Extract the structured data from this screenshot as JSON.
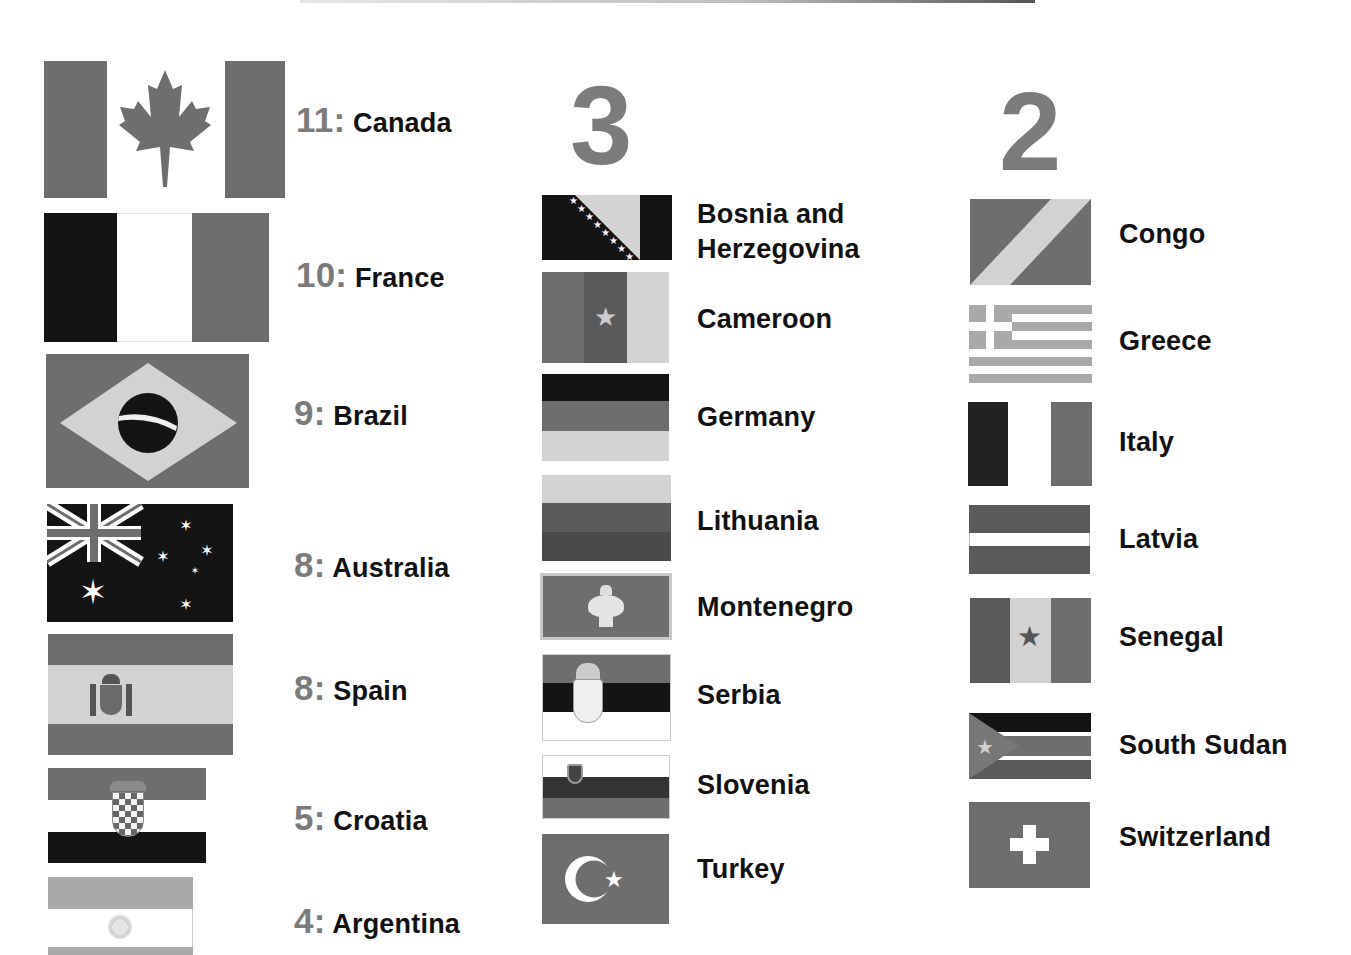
{
  "colors": {
    "dark": "#141414",
    "mid": "#6e6e6e",
    "light": "#d2d2d2",
    "number": "#7b7b7b"
  },
  "ranked": [
    {
      "num": "11:",
      "name": "Canada"
    },
    {
      "num": "10:",
      "name": "France"
    },
    {
      "num": "9:",
      "name": "Brazil"
    },
    {
      "num": "8:",
      "name": "Australia"
    },
    {
      "num": "8:",
      "name": "Spain"
    },
    {
      "num": "5:",
      "name": "Croatia"
    },
    {
      "num": "4:",
      "name": "Argentina"
    }
  ],
  "group3": {
    "heading": "3",
    "countries": [
      "Bosnia and",
      "Herzegovina",
      "Cameroon",
      "Germany",
      "Lithuania",
      "Montenegro",
      "Serbia",
      "Slovenia",
      "Turkey"
    ]
  },
  "group2": {
    "heading": "2",
    "countries": [
      "Congo",
      "Greece",
      "Italy",
      "Latvia",
      "Senegal",
      "South Sudan",
      "Switzerland"
    ]
  }
}
